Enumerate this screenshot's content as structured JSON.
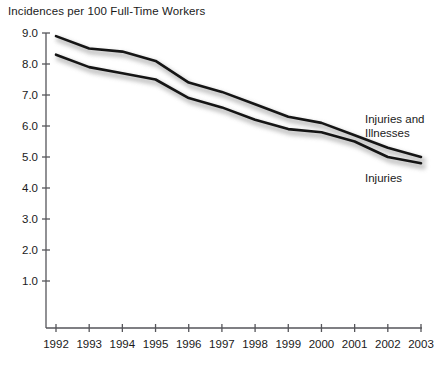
{
  "chart_data": {
    "type": "line",
    "title": "Incidences per 100 Full-Time Workers",
    "xlabel": "",
    "ylabel": "",
    "x": [
      1992,
      1993,
      1994,
      1995,
      1996,
      1997,
      1998,
      1999,
      2000,
      2001,
      2002,
      2003
    ],
    "categories": [
      "1992",
      "1993",
      "1994",
      "1995",
      "1996",
      "1997",
      "1998",
      "1999",
      "2000",
      "2001",
      "2002",
      "2003"
    ],
    "series": [
      {
        "name": "Injuries and Illnesses",
        "values": [
          8.9,
          8.5,
          8.4,
          8.1,
          7.4,
          7.1,
          6.7,
          6.3,
          6.1,
          5.7,
          5.3,
          5.0
        ]
      },
      {
        "name": "Injuries",
        "values": [
          8.3,
          7.9,
          7.7,
          7.5,
          6.9,
          6.6,
          6.2,
          5.9,
          5.8,
          5.5,
          5.0,
          4.8
        ]
      }
    ],
    "ylim": [
      0.0,
      9.0
    ],
    "yticks": [
      "1.0",
      "2.0",
      "3.0",
      "4.0",
      "5.0",
      "6.0",
      "7.0",
      "8.0",
      "9.0"
    ],
    "ytick_values": [
      1.0,
      2.0,
      3.0,
      4.0,
      5.0,
      6.0,
      7.0,
      8.0,
      9.0
    ],
    "xlim": [
      1992,
      2003
    ],
    "grid": false,
    "legend_position": "inline-right",
    "annotations": [
      {
        "text": "Injuries and",
        "series": "Injuries and Illnesses"
      },
      {
        "text": "Illnesses",
        "series": "Injuries and Illnesses"
      },
      {
        "text": "Injuries",
        "series": "Injuries"
      }
    ],
    "colors": {
      "line": "#151515",
      "shadow": "#b4b4b4",
      "axis": "#55555a",
      "text": "#1a1a1a",
      "background": "#ffffff"
    }
  }
}
